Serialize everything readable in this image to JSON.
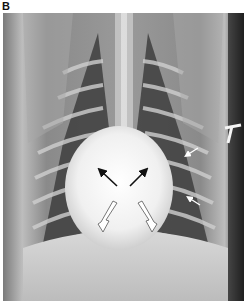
{
  "figure": {
    "panel_label": "B",
    "image_type": "thoracic radiograph (ventrodorsal view)",
    "annotations": {
      "black_arrows": {
        "count": 2,
        "direction": "up-outward",
        "color": "#111111"
      },
      "white_outlined_arrows": {
        "count": 2,
        "direction": "down-outward",
        "color": "#ffffff"
      },
      "small_white_arrows": {
        "count": 2,
        "location": "right cardiac border",
        "color": "#ffffff"
      }
    },
    "colors": {
      "background": "#ffffff",
      "film_mid": "#6e6e6e",
      "lung_dark": "#3a3a3a",
      "bone_bright": "#e8e8e8",
      "heart_silhouette": "#f2f2f2"
    }
  }
}
